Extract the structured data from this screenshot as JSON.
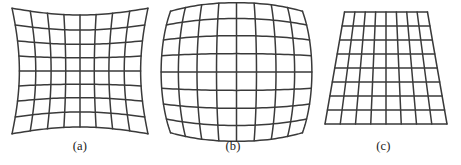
{
  "figure": {
    "name": "geometric-distortion-grid-figure",
    "background_color": "#ffffff",
    "line_color": "#3a3a3a",
    "width": 461,
    "height": 165,
    "panel_count": 3
  },
  "panels": [
    {
      "id": "a",
      "label": "(a)",
      "distortion": "pincushion",
      "grid_rows": 8,
      "grid_cols": 8,
      "bbox": {
        "x": 14,
        "y": 10,
        "width": 132,
        "height": 122
      },
      "bulge": -0.085,
      "line_width": 1.5
    },
    {
      "id": "b",
      "label": "(b)",
      "distortion": "barrel",
      "grid_rows": 8,
      "grid_cols": 8,
      "bbox": {
        "x": 16,
        "y": 9,
        "width": 137,
        "height": 126
      },
      "bulge": 0.105,
      "line_width": 1.5
    },
    {
      "id": "c",
      "label": "(c)",
      "distortion": "keystone",
      "grid_rows": 8,
      "grid_cols": 8,
      "bbox": {
        "x": 19,
        "y": 12,
        "width": 122,
        "height": 112
      },
      "top_width_ratio": 0.68,
      "line_width": 1.5
    }
  ],
  "chart_data": {
    "type": "diagram",
    "title": "",
    "subtitle": "",
    "categories": [
      "(a)",
      "(b)",
      "(c)"
    ],
    "series": [
      {
        "name": "distortion_type",
        "values": [
          "pincushion",
          "barrel",
          "keystone"
        ]
      },
      {
        "name": "grid_rows",
        "values": [
          8,
          8,
          8
        ]
      },
      {
        "name": "grid_cols",
        "values": [
          8,
          8,
          8
        ]
      },
      {
        "name": "bulge_coefficient",
        "values": [
          -0.085,
          0.105,
          0.0
        ]
      }
    ],
    "xlabel": "",
    "ylabel": "",
    "grid": true,
    "legend": "none"
  }
}
